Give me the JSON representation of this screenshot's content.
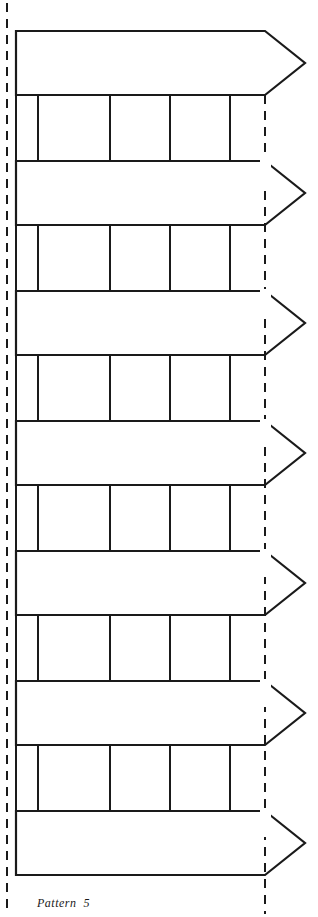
{
  "document": {
    "title": "Pattern 5",
    "caption": "Pattern  5",
    "kind": "cut-and-fold paper pattern sheet",
    "background_color": "#ffffff",
    "ink_color": "#1a1a1a"
  },
  "canvas": {
    "width": 318,
    "height": 917
  },
  "guides": {
    "type": "dashed-vertical-fold-line",
    "color": "#1a1a1a",
    "stroke_width": 2,
    "dash": "9 7",
    "left_x": 7,
    "right_x": 265,
    "left_top": 3,
    "left_bottom": 914,
    "right_top": 95,
    "right_bottom": 914
  },
  "arrows": {
    "count": 7,
    "shaft_left_x": 16,
    "shoulder_x": 265,
    "tip_x": 305,
    "band_height": 64,
    "period": 130,
    "stroke_width": 2.2,
    "fill": "#ffffff",
    "tops": [
      31,
      161,
      291,
      421,
      551,
      681,
      811
    ]
  },
  "connector_bands": {
    "count": 6,
    "left_x": 16,
    "right_x": 265,
    "height": 66,
    "tops": [
      95,
      225,
      355,
      485,
      615,
      745
    ],
    "stroke_width": 2.0,
    "divider_x": [
      38,
      110,
      170,
      230
    ],
    "divider_count": 4
  },
  "legend": {
    "solid_line_meaning": "cut line",
    "dashed_line_meaning": "fold line"
  }
}
